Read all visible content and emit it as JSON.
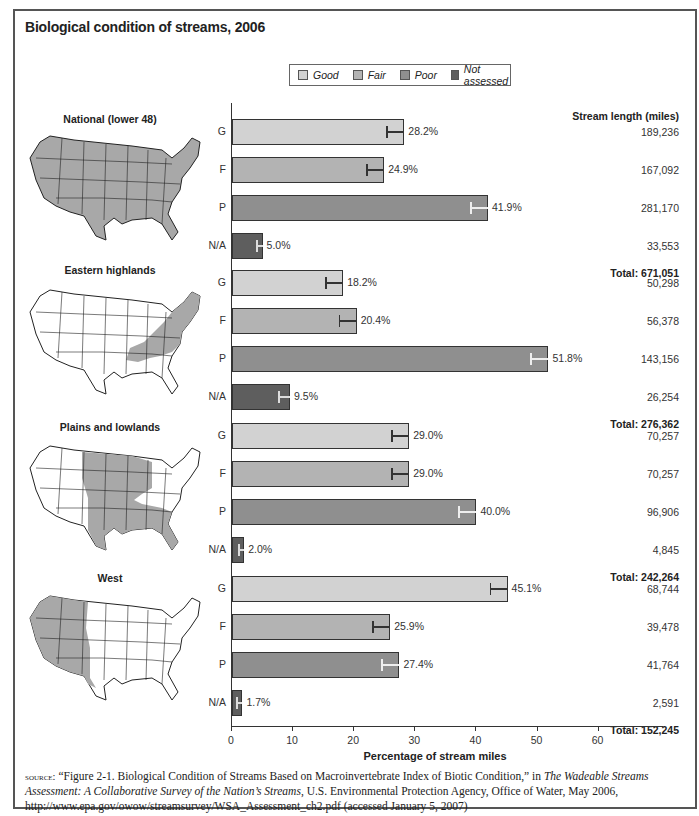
{
  "title": "Biological condition of streams, 2006",
  "legend": [
    {
      "label": "Good",
      "color": "#d2d2d2"
    },
    {
      "label": "Fair",
      "color": "#b3b3b3"
    },
    {
      "label": "Poor",
      "color": "#8f8f8f"
    },
    {
      "label": "Not assessed",
      "color": "#5e5e5e"
    }
  ],
  "miles_header": "Stream length (miles)",
  "x_axis": {
    "label": "Percentage of stream miles",
    "ticks": [
      "0",
      "10",
      "20",
      "30",
      "40",
      "50",
      "60"
    ]
  },
  "regions": [
    {
      "name": "National (lower 48)",
      "rows": [
        {
          "cat": "G",
          "value": 28.2,
          "label": "28.2%",
          "miles": "189,236"
        },
        {
          "cat": "F",
          "value": 24.9,
          "label": "24.9%",
          "miles": "167,092"
        },
        {
          "cat": "P",
          "value": 41.9,
          "label": "41.9%",
          "miles": "281,170"
        },
        {
          "cat": "N/A",
          "value": 5.0,
          "label": "5.0%",
          "miles": "33,553"
        }
      ],
      "total": "Total: 671,051"
    },
    {
      "name": "Eastern highlands",
      "rows": [
        {
          "cat": "G",
          "value": 18.2,
          "label": "18.2%",
          "miles": "50,298"
        },
        {
          "cat": "F",
          "value": 20.4,
          "label": "20.4%",
          "miles": "56,378"
        },
        {
          "cat": "P",
          "value": 51.8,
          "label": "51.8%",
          "miles": "143,156"
        },
        {
          "cat": "N/A",
          "value": 9.5,
          "label": "9.5%",
          "miles": "26,254"
        }
      ],
      "total": "Total: 276,362"
    },
    {
      "name": "Plains and lowlands",
      "rows": [
        {
          "cat": "G",
          "value": 29.0,
          "label": "29.0%",
          "miles": "70,257"
        },
        {
          "cat": "F",
          "value": 29.0,
          "label": "29.0%",
          "miles": "70,257"
        },
        {
          "cat": "P",
          "value": 40.0,
          "label": "40.0%",
          "miles": "96,906"
        },
        {
          "cat": "N/A",
          "value": 2.0,
          "label": "2.0%",
          "miles": "4,845"
        }
      ],
      "total": "Total: 242,264"
    },
    {
      "name": "West",
      "rows": [
        {
          "cat": "G",
          "value": 45.1,
          "label": "45.1%",
          "miles": "68,744"
        },
        {
          "cat": "F",
          "value": 25.9,
          "label": "25.9%",
          "miles": "39,478"
        },
        {
          "cat": "P",
          "value": 27.4,
          "label": "27.4%",
          "miles": "41,764"
        },
        {
          "cat": "N/A",
          "value": 1.7,
          "label": "1.7%",
          "miles": "2,591"
        }
      ],
      "total": "Total: 152,245"
    }
  ],
  "source": {
    "prefix": "source:",
    "part1": " “Figure  2-1. Biological Condition of Streams Based on Macroinvertebrate Index of Biotic Condition,” in ",
    "italic": "The Wadeable Streams Assessment: A Collaborative Survey of the Nation’s Streams",
    "part2": ", U.S. Environmental Protection Agency, Office of Water, May 2006, http://www.epa.gov/owow/streamsurvey/WSA_Assessment_ch2.pdf (accessed January 5, 2007)"
  },
  "chart_data": {
    "type": "bar",
    "orientation": "horizontal",
    "title": "Biological condition of streams, 2006",
    "xlabel": "Percentage of stream miles",
    "ylabel": "",
    "xlim": [
      0,
      60
    ],
    "xticks": [
      0,
      10,
      20,
      30,
      40,
      50,
      60
    ],
    "grid": false,
    "legend_position": "top",
    "categories": [
      "Good",
      "Fair",
      "Poor",
      "Not assessed"
    ],
    "series": [
      {
        "name": "National (lower 48)",
        "values": [
          28.2,
          24.9,
          41.9,
          5.0
        ],
        "miles": [
          189236,
          167092,
          281170,
          33553
        ],
        "total_miles": 671051
      },
      {
        "name": "Eastern highlands",
        "values": [
          18.2,
          20.4,
          51.8,
          9.5
        ],
        "miles": [
          50298,
          56378,
          143156,
          26254
        ],
        "total_miles": 276362
      },
      {
        "name": "Plains and lowlands",
        "values": [
          29.0,
          29.0,
          40.0,
          2.0
        ],
        "miles": [
          70257,
          70257,
          96906,
          4845
        ],
        "total_miles": 242264
      },
      {
        "name": "West",
        "values": [
          45.1,
          25.9,
          27.4,
          1.7
        ],
        "miles": [
          68744,
          39478,
          41764,
          2591
        ],
        "total_miles": 152245
      }
    ],
    "annotations": [
      "Stream length (miles)",
      "Error bars shown on each bar"
    ]
  }
}
